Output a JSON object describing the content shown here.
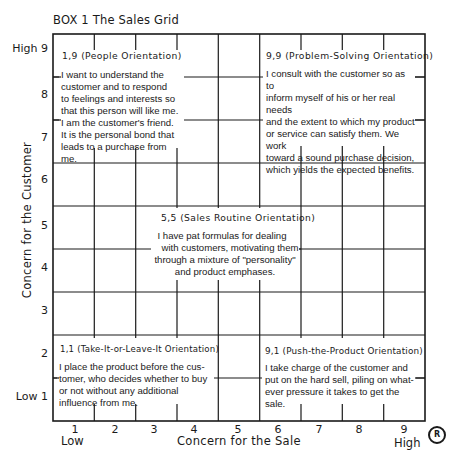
{
  "title": "BOX 1 The Sales Grid",
  "axes": {
    "x_title": "Concern for the Sale",
    "y_title": "Concern for the Customer",
    "x_low": "Low",
    "x_high": "High",
    "y_ticks": [
      "High 9",
      "8",
      "7",
      "6",
      "5",
      "4",
      "3",
      "2",
      "Low 1"
    ],
    "x_ticks": [
      "1",
      "2",
      "3",
      "4",
      "5",
      "6",
      "7",
      "8",
      "9"
    ],
    "registered_mark": "R"
  },
  "orientations": {
    "people": {
      "heading": "1,9 (People Orientation)",
      "lines": [
        "I want to understand the",
        "customer and to respond",
        "to feelings and interests so",
        "that this person will like me.",
        "I am the customer's friend.",
        "It is the personal bond that",
        "leads to a purchase from me."
      ]
    },
    "problem_solving": {
      "heading": "9,9 (Problem-Solving Orientation)",
      "lines": [
        "I consult with the customer so as to",
        "inform myself of his or her real needs",
        "and the extent to which my product",
        "or service can satisfy them. We work",
        "toward a sound purchase decision,",
        "which yields the expected benefits."
      ]
    },
    "sales_routine": {
      "heading": "5,5 (Sales Routine Orientation)",
      "lines": [
        "I have pat formulas for dealing",
        "with customers, motivating them",
        "through a mixture of \"personality\"",
        "and product emphases."
      ]
    },
    "take_it_or_leave_it": {
      "heading": "1,1 (Take-It-or-Leave-It Orientation)",
      "lines": [
        "I place the product before the cus-",
        "tomer, who decides whether to buy",
        "or not without any additional",
        "influence from me."
      ]
    },
    "push_the_product": {
      "heading": "9,1 (Push-the-Product Orientation)",
      "lines": [
        "I take charge of the customer and",
        "put on the hard  sell, piling on what-",
        "ever pressure it takes to get the",
        "sale."
      ]
    }
  },
  "colors": {
    "ink": "#1a1a1a",
    "background": "#ffffff"
  }
}
